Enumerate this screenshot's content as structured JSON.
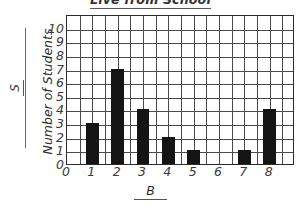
{
  "chart_data": {
    "type": "bar",
    "title": "Live from School",
    "xlabel": "B",
    "ylabel": "Number of Students",
    "y_axis_symbol": "S",
    "categories": [
      "0",
      "1",
      "2",
      "3",
      "4",
      "5",
      "6",
      "7",
      "8"
    ],
    "values": [
      0,
      3,
      7,
      4,
      2,
      1,
      0,
      1,
      4
    ],
    "xlim": [
      0,
      9
    ],
    "ylim": [
      0,
      10
    ],
    "y_ticks": [
      "0",
      "1",
      "2",
      "3",
      "4",
      "5",
      "6",
      "7",
      "8",
      "9",
      "10"
    ],
    "x_ticks": [
      "0",
      "1",
      "2",
      "3",
      "4",
      "5",
      "6",
      "7",
      "8"
    ],
    "grid": true,
    "grid_columns": 18,
    "grid_rows": 11,
    "legend": null,
    "bar_color": "#141414",
    "axis_color": "#2b2b2b",
    "grid_color": "#4a4a4a"
  }
}
